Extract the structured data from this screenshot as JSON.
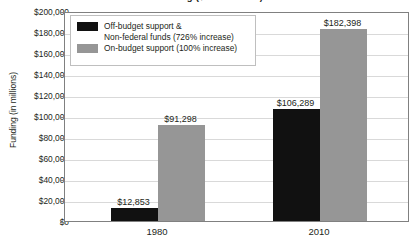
{
  "chart_data": {
    "type": "bar",
    "title": "Funding ($2015 Billion)",
    "xlabel": "",
    "ylabel": "Funding (in millions)",
    "ylim": [
      0,
      200000
    ],
    "ytick_step": 20000,
    "grid": true,
    "legend_position": "top-left",
    "categories": [
      "1980",
      "2010"
    ],
    "series": [
      {
        "name": "Off-budget support & Non-federal funds (726% increase)",
        "color": "#111111",
        "values": [
          12853,
          106289
        ],
        "labels": [
          "$12,853",
          "$106,289"
        ]
      },
      {
        "name": "On-budget support (100% increase)",
        "color": "#969696",
        "values": [
          91298,
          182398
        ],
        "labels": [
          "$91,298",
          "$182,398"
        ]
      }
    ],
    "ytick_labels": [
      "$200,000",
      "$180,000",
      "$160,000",
      "$140,000",
      "$120,000",
      "$100,000",
      "$80,000",
      "$60,000",
      "$40,000",
      "$20,000",
      "$0"
    ],
    "ytick_values": [
      200000,
      180000,
      160000,
      140000,
      120000,
      100000,
      80000,
      60000,
      40000,
      20000,
      0
    ]
  },
  "legend": {
    "series1_line1": "Off-budget support &",
    "series1_line2": "Non-federal funds (726% increase)",
    "series2_line1": "On-budget support (100% increase)"
  },
  "axis": {
    "y_title": "Funding (in millions)"
  }
}
